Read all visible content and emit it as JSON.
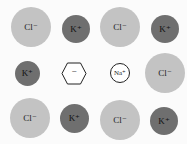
{
  "diagram": {
    "title": "",
    "ions": [
      {
        "label": "Cl⁻",
        "type": "chloride"
      },
      {
        "label": "K⁺",
        "type": "potassium"
      },
      {
        "label": "Cl⁻",
        "type": "chloride"
      },
      {
        "label": "K⁺",
        "type": "potassium"
      },
      {
        "label": "K⁺",
        "type": "potassium"
      },
      {
        "label": "−",
        "type": "anion-hexagon"
      },
      {
        "label": "Na⁺",
        "type": "sodium"
      },
      {
        "label": "Cl⁻",
        "type": "chloride"
      },
      {
        "label": "Cl⁻",
        "type": "chloride"
      },
      {
        "label": "K⁺",
        "type": "potassium"
      },
      {
        "label": "Cl⁻",
        "type": "chloride"
      },
      {
        "label": "K⁺",
        "type": "potassium"
      }
    ],
    "colors": {
      "chloride": "#c3c3c3",
      "potassium": "#6f6f6f",
      "sodium": "#ffffff"
    }
  }
}
